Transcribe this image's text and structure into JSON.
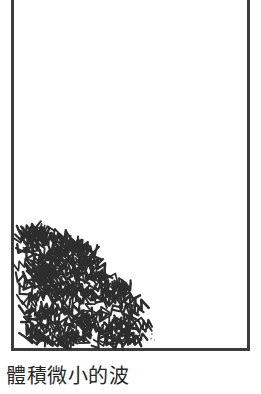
{
  "figure": {
    "caption": "體積微小的波",
    "frame": {
      "style": "open-top-rectangle",
      "color": "#3c3c3c",
      "stroke_width_px": 3,
      "left_px": 11,
      "right_px": 250,
      "bottom_px": 351,
      "top_open": true
    },
    "background_color": "#ffffff",
    "texture": {
      "name": "wave-squiggle-field",
      "description": "dense field of small zigzag wave strokes filling the lower-left corner",
      "ink_color": "#2e2e2e",
      "stroke_width_px": 2,
      "origin_corner": "bottom-left",
      "boundary_shape": "convex-diagonal",
      "top_extent_px": 228,
      "right_extent_px": 150,
      "bottom_extent_px": 348,
      "left_extent_px": 14,
      "stroke_count": 260
    }
  }
}
